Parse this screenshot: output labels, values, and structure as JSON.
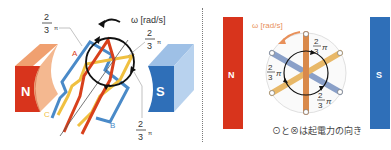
{
  "left_diagram": {
    "magnet_north_label": "N",
    "magnet_south_label": "S",
    "omega_label": "ω [rad/s]",
    "coil_labels": {
      "a": "A",
      "b": "B",
      "c": "C"
    },
    "angle_labels": [
      {
        "numerator": "2",
        "denominator": "3",
        "symbol": "π"
      },
      {
        "numerator": "2",
        "denominator": "3",
        "symbol": "π"
      },
      {
        "numerator": "2",
        "denominator": "3",
        "symbol": "π"
      }
    ]
  },
  "right_diagram": {
    "magnet_north_label": "N",
    "magnet_south_label": "S",
    "omega_label": "ω [rad/s]",
    "angle_labels": [
      {
        "numerator": "2",
        "denominator": "3",
        "symbol": "π"
      },
      {
        "numerator": "2",
        "denominator": "3",
        "symbol": "π"
      },
      {
        "numerator": "2",
        "denominator": "3",
        "symbol": "π"
      }
    ],
    "caption": "⊙と⊗は起電力の向き"
  },
  "colors": {
    "north_red": "#d8341c",
    "north_light": "#f0a070",
    "south_blue": "#2f6fb8",
    "south_light": "#9ec0e6",
    "coil_a_red": "#d8401c",
    "coil_b_blue": "#4a8ac8",
    "coil_c_yellow": "#f0c040",
    "coil_bar_orange": "#d9894a",
    "coil_bar_blue": "#8aa0c8",
    "coil_bar_yellow": "#e8b868",
    "arrow_orange": "#e8905a"
  }
}
